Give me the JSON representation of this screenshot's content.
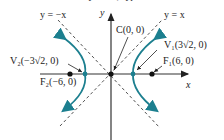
{
  "caption_partial": "the h... y ... 18, hyperbola",
  "colors": {
    "curve": "#1c7f8f",
    "axis": "#333333",
    "asymptote": "#555555",
    "point": "#111111"
  },
  "asymptotes": {
    "neg": "y = −x",
    "pos": "y = x"
  },
  "axes": {
    "x_label": "x",
    "y_label": "y"
  },
  "points": {
    "center": "C(0, 0)",
    "v1": "V₁(3√2, 0)",
    "v2": "V₂(−3√2, 0)",
    "f1": "F₁(6, 0)",
    "f2": "F₂(−6, 0)"
  }
}
